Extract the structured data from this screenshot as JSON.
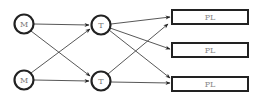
{
  "diagram": {
    "type": "flow-network",
    "colors": {
      "stroke": "#222222",
      "edge": "#444444",
      "label": "#777777",
      "background": "#ffffff"
    },
    "nodes": {
      "m1": {
        "label": "M",
        "shape": "circle"
      },
      "m2": {
        "label": "M",
        "shape": "circle"
      },
      "t1": {
        "label": "T",
        "shape": "circle"
      },
      "t2": {
        "label": "T",
        "shape": "circle"
      },
      "pl1": {
        "label": "PL",
        "shape": "rectangle"
      },
      "pl2": {
        "label": "PL",
        "shape": "rectangle"
      },
      "pl3": {
        "label": "PL",
        "shape": "rectangle"
      }
    },
    "edges": [
      {
        "from": "m1",
        "to": "t1"
      },
      {
        "from": "m1",
        "to": "t2"
      },
      {
        "from": "m2",
        "to": "t1"
      },
      {
        "from": "m2",
        "to": "t2"
      },
      {
        "from": "t1",
        "to": "pl1"
      },
      {
        "from": "t1",
        "to": "pl2"
      },
      {
        "from": "t1",
        "to": "pl3"
      },
      {
        "from": "t2",
        "to": "pl1"
      },
      {
        "from": "t2",
        "to": "pl3"
      }
    ]
  }
}
